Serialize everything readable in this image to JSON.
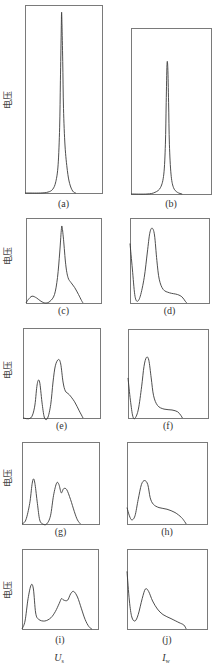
{
  "chart_data": {
    "type": "line",
    "title": "",
    "ylabel": "电压",
    "column_xlabels": [
      {
        "main": "U",
        "sub": "s"
      },
      {
        "main": "I",
        "sub": "w"
      }
    ],
    "grid": false,
    "ylim": [
      0,
      1
    ],
    "xlim": [
      0,
      1
    ],
    "panels": [
      {
        "label": "(a)",
        "column": 0,
        "row": 0,
        "show_ylabel": true,
        "points": [
          [
            0,
            0
          ],
          [
            0.2,
            0
          ],
          [
            0.3,
            0.005
          ],
          [
            0.36,
            0.02
          ],
          [
            0.4,
            0.06
          ],
          [
            0.43,
            0.15
          ],
          [
            0.45,
            0.35
          ],
          [
            0.46,
            0.6
          ],
          [
            0.47,
            0.85
          ],
          [
            0.475,
            0.96
          ],
          [
            0.48,
            0.9
          ],
          [
            0.49,
            0.7
          ],
          [
            0.5,
            0.45
          ],
          [
            0.52,
            0.25
          ],
          [
            0.55,
            0.12
          ],
          [
            0.58,
            0.05
          ],
          [
            0.62,
            0.01
          ],
          [
            0.66,
            0
          ]
        ]
      },
      {
        "label": "(b)",
        "column": 1,
        "row": 0,
        "show_ylabel": false,
        "points": [
          [
            0,
            0
          ],
          [
            0.2,
            0
          ],
          [
            0.3,
            0.01
          ],
          [
            0.37,
            0.04
          ],
          [
            0.41,
            0.12
          ],
          [
            0.43,
            0.3
          ],
          [
            0.44,
            0.55
          ],
          [
            0.45,
            0.78
          ],
          [
            0.46,
            0.76
          ],
          [
            0.47,
            0.55
          ],
          [
            0.48,
            0.3
          ],
          [
            0.5,
            0.12
          ],
          [
            0.53,
            0.04
          ],
          [
            0.58,
            0.01
          ],
          [
            0.64,
            0
          ]
        ]
      },
      {
        "label": "(c)",
        "column": 0,
        "row": 1,
        "show_ylabel": true,
        "points": [
          [
            0,
            0
          ],
          [
            0.03,
            0.04
          ],
          [
            0.08,
            0.08
          ],
          [
            0.14,
            0.06
          ],
          [
            0.2,
            0.02
          ],
          [
            0.26,
            0
          ],
          [
            0.32,
            0.02
          ],
          [
            0.38,
            0.1
          ],
          [
            0.42,
            0.3
          ],
          [
            0.45,
            0.6
          ],
          [
            0.47,
            0.85
          ],
          [
            0.48,
            0.9
          ],
          [
            0.5,
            0.75
          ],
          [
            0.53,
            0.45
          ],
          [
            0.56,
            0.3
          ],
          [
            0.6,
            0.24
          ],
          [
            0.65,
            0.18
          ],
          [
            0.7,
            0.1
          ],
          [
            0.74,
            0.03
          ],
          [
            0.76,
            0
          ]
        ]
      },
      {
        "label": "(d)",
        "column": 1,
        "row": 1,
        "show_ylabel": false,
        "points": [
          [
            0,
            0.7
          ],
          [
            0.03,
            0.4
          ],
          [
            0.06,
            0.1
          ],
          [
            0.09,
            0.02
          ],
          [
            0.13,
            0.08
          ],
          [
            0.18,
            0.3
          ],
          [
            0.22,
            0.6
          ],
          [
            0.25,
            0.82
          ],
          [
            0.28,
            0.88
          ],
          [
            0.31,
            0.8
          ],
          [
            0.34,
            0.5
          ],
          [
            0.37,
            0.28
          ],
          [
            0.42,
            0.16
          ],
          [
            0.5,
            0.12
          ],
          [
            0.6,
            0.1
          ],
          [
            0.66,
            0.07
          ],
          [
            0.7,
            0.02
          ],
          [
            0.72,
            0
          ]
        ]
      },
      {
        "label": "(e)",
        "column": 0,
        "row": 2,
        "show_ylabel": true,
        "points": [
          [
            0,
            0
          ],
          [
            0.1,
            0
          ],
          [
            0.15,
            0.12
          ],
          [
            0.18,
            0.35
          ],
          [
            0.2,
            0.42
          ],
          [
            0.22,
            0.38
          ],
          [
            0.25,
            0.15
          ],
          [
            0.28,
            0
          ],
          [
            0.32,
            0
          ],
          [
            0.36,
            0.15
          ],
          [
            0.39,
            0.4
          ],
          [
            0.42,
            0.58
          ],
          [
            0.46,
            0.65
          ],
          [
            0.49,
            0.6
          ],
          [
            0.52,
            0.4
          ],
          [
            0.55,
            0.3
          ],
          [
            0.6,
            0.26
          ],
          [
            0.67,
            0.18
          ],
          [
            0.73,
            0.08
          ],
          [
            0.78,
            0
          ]
        ]
      },
      {
        "label": "(f)",
        "column": 1,
        "row": 2,
        "show_ylabel": false,
        "points": [
          [
            0,
            0.45
          ],
          [
            0.03,
            0.2
          ],
          [
            0.06,
            0.02
          ],
          [
            0.09,
            0
          ],
          [
            0.13,
            0.1
          ],
          [
            0.17,
            0.35
          ],
          [
            0.2,
            0.58
          ],
          [
            0.23,
            0.68
          ],
          [
            0.26,
            0.65
          ],
          [
            0.29,
            0.45
          ],
          [
            0.32,
            0.25
          ],
          [
            0.37,
            0.14
          ],
          [
            0.45,
            0.1
          ],
          [
            0.55,
            0.09
          ],
          [
            0.62,
            0.07
          ],
          [
            0.66,
            0.03
          ],
          [
            0.68,
            0
          ]
        ]
      },
      {
        "label": "(g)",
        "column": 0,
        "row": 3,
        "show_ylabel": true,
        "points": [
          [
            0,
            0
          ],
          [
            0.05,
            0.05
          ],
          [
            0.1,
            0.25
          ],
          [
            0.13,
            0.48
          ],
          [
            0.15,
            0.55
          ],
          [
            0.17,
            0.48
          ],
          [
            0.2,
            0.25
          ],
          [
            0.23,
            0.05
          ],
          [
            0.27,
            0
          ],
          [
            0.32,
            0
          ],
          [
            0.37,
            0.1
          ],
          [
            0.41,
            0.35
          ],
          [
            0.45,
            0.5
          ],
          [
            0.48,
            0.48
          ],
          [
            0.51,
            0.38
          ],
          [
            0.54,
            0.43
          ],
          [
            0.58,
            0.42
          ],
          [
            0.63,
            0.3
          ],
          [
            0.68,
            0.15
          ],
          [
            0.72,
            0.05
          ],
          [
            0.76,
            0
          ]
        ]
      },
      {
        "label": "(h)",
        "column": 1,
        "row": 3,
        "show_ylabel": false,
        "points": [
          [
            0,
            0.2
          ],
          [
            0.03,
            0.1
          ],
          [
            0.06,
            0.05
          ],
          [
            0.1,
            0.1
          ],
          [
            0.14,
            0.3
          ],
          [
            0.18,
            0.48
          ],
          [
            0.22,
            0.53
          ],
          [
            0.26,
            0.48
          ],
          [
            0.29,
            0.32
          ],
          [
            0.33,
            0.24
          ],
          [
            0.4,
            0.2
          ],
          [
            0.5,
            0.18
          ],
          [
            0.6,
            0.14
          ],
          [
            0.68,
            0.08
          ],
          [
            0.72,
            0.03
          ],
          [
            0.74,
            0
          ]
        ]
      },
      {
        "label": "(i)",
        "column": 0,
        "row": 4,
        "show_ylabel": true,
        "points": [
          [
            0,
            0
          ],
          [
            0.04,
            0.1
          ],
          [
            0.08,
            0.38
          ],
          [
            0.12,
            0.55
          ],
          [
            0.15,
            0.5
          ],
          [
            0.18,
            0.2
          ],
          [
            0.22,
            0.12
          ],
          [
            0.3,
            0.1
          ],
          [
            0.38,
            0.14
          ],
          [
            0.44,
            0.22
          ],
          [
            0.49,
            0.32
          ],
          [
            0.52,
            0.38
          ],
          [
            0.55,
            0.36
          ],
          [
            0.6,
            0.36
          ],
          [
            0.64,
            0.44
          ],
          [
            0.68,
            0.47
          ],
          [
            0.73,
            0.4
          ],
          [
            0.78,
            0.26
          ],
          [
            0.83,
            0.12
          ],
          [
            0.88,
            0.03
          ],
          [
            0.92,
            0
          ]
        ]
      },
      {
        "label": "(j)",
        "column": 1,
        "row": 4,
        "show_ylabel": false,
        "points": [
          [
            0,
            0.72
          ],
          [
            0.03,
            0.35
          ],
          [
            0.06,
            0.15
          ],
          [
            0.1,
            0.1
          ],
          [
            0.14,
            0.18
          ],
          [
            0.19,
            0.38
          ],
          [
            0.23,
            0.5
          ],
          [
            0.27,
            0.47
          ],
          [
            0.32,
            0.35
          ],
          [
            0.38,
            0.25
          ],
          [
            0.45,
            0.18
          ],
          [
            0.55,
            0.13
          ],
          [
            0.65,
            0.08
          ],
          [
            0.71,
            0.05
          ],
          [
            0.74,
            0
          ]
        ]
      }
    ]
  }
}
